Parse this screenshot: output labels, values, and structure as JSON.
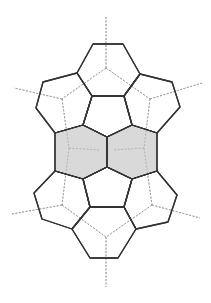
{
  "diagram": {
    "title": "",
    "colors": {
      "edge": "#333333",
      "shaded_fill": "#d9d9d9",
      "hidden_edge": "#9a9a9a",
      "background": "#ffffff"
    },
    "faces": [
      {
        "id": "pent-top",
        "shaded": false,
        "points": "93,44 123,44 140,74 124,96 92,96 77,73"
      },
      {
        "id": "pent-center-top",
        "shaded": false,
        "points": "92,96 124,96 132,125 107,137 83,125"
      },
      {
        "id": "pent-upper-left",
        "shaded": false,
        "points": "77,73 92,96 83,125 55,133 36,108 43,82"
      },
      {
        "id": "pent-upper-right",
        "shaded": false,
        "points": "140,74 172,82 180,107 157,133 132,125 124,96"
      },
      {
        "id": "hex-left",
        "shaded": true,
        "points": "55,133 83,125 107,137 107,167 83,179 55,171"
      },
      {
        "id": "hex-right",
        "shaded": true,
        "points": "107,137 132,125 157,133 157,171 132,179 107,167"
      },
      {
        "id": "pent-center-bottom",
        "shaded": false,
        "points": "83,179 107,167 132,179 124,207 90,207"
      },
      {
        "id": "pent-lower-left",
        "shaded": false,
        "points": "55,171 83,179 90,207 72,229 42,219 34,193"
      },
      {
        "id": "pent-lower-right",
        "shaded": false,
        "points": "132,179 157,171 177,195 168,222 136,229 124,207"
      },
      {
        "id": "pent-bottom",
        "shaded": false,
        "points": "90,207 124,207 136,229 118,258 90,258 72,229"
      }
    ],
    "hidden_edges": [
      "106,17 106,68",
      "106,68 62,99",
      "106,68 150,99",
      "62,99 14,88",
      "150,99 202,83",
      "62,99 69,148",
      "150,99 144,148",
      "69,148 100,150",
      "114,150 144,148",
      "69,148 62,205",
      "144,148 152,205",
      "62,205 12,214",
      "152,205 200,218",
      "62,205 106,237",
      "152,205 106,237",
      "106,237 106,287"
    ]
  }
}
